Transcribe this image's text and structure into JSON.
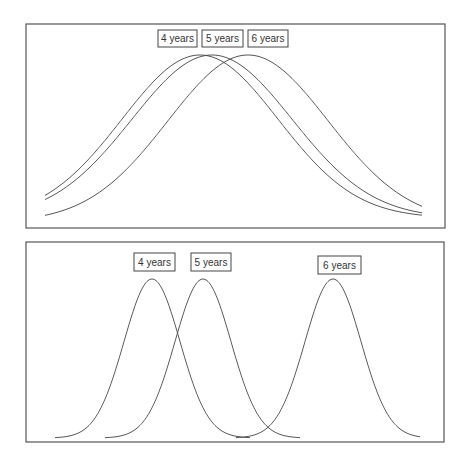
{
  "panels": [
    {
      "name": "top-panel",
      "frame": {
        "x": 26,
        "y": 24,
        "w": 419,
        "h": 204
      },
      "baseline_x": [
        45,
        422
      ],
      "curves": [
        {
          "label": "4 years",
          "mu": 200,
          "sigma": 78,
          "peak_y": 55,
          "base_y": 218,
          "x0": 45,
          "x1": 422
        },
        {
          "label": "5 years",
          "mu": 212,
          "sigma": 80,
          "peak_y": 55,
          "base_y": 218,
          "x0": 45,
          "x1": 422
        },
        {
          "label": "6 years",
          "mu": 248,
          "sigma": 80,
          "peak_y": 55,
          "base_y": 222,
          "x0": 45,
          "x1": 422
        }
      ],
      "labels": [
        {
          "text": "4 years",
          "x": 158,
          "y": 30,
          "w": 39,
          "h": 17
        },
        {
          "text": "5 years",
          "x": 202,
          "y": 30,
          "w": 41,
          "h": 17
        },
        {
          "text": "6 years",
          "x": 248,
          "y": 30,
          "w": 40,
          "h": 17
        }
      ]
    },
    {
      "name": "bottom-panel",
      "frame": {
        "x": 26,
        "y": 242,
        "w": 418,
        "h": 200
      },
      "curves": [
        {
          "label": "4 years",
          "mu": 152,
          "sigma": 28,
          "peak_y": 279,
          "base_y": 438,
          "x0": 55,
          "x1": 250
        },
        {
          "label": "5 years",
          "mu": 203,
          "sigma": 28,
          "peak_y": 279,
          "base_y": 438,
          "x0": 105,
          "x1": 300
        },
        {
          "label": "6 years",
          "mu": 333,
          "sigma": 28,
          "peak_y": 279,
          "base_y": 438,
          "x0": 236,
          "x1": 420
        }
      ],
      "labels": [
        {
          "text": "4 years",
          "x": 134,
          "y": 253,
          "w": 41,
          "h": 18
        },
        {
          "text": "5 years",
          "x": 191,
          "y": 253,
          "w": 40,
          "h": 18
        },
        {
          "text": "6 years",
          "x": 318,
          "y": 256,
          "w": 43,
          "h": 18
        }
      ]
    }
  ],
  "chart_data": [
    {
      "type": "line",
      "title": "",
      "description": "Three heavily overlapping bell curves (wide spread, close means)",
      "series": [
        {
          "name": "4 years",
          "mean_px": 200,
          "relative_spread": "wide"
        },
        {
          "name": "5 years",
          "mean_px": 212,
          "relative_spread": "wide"
        },
        {
          "name": "6 years",
          "mean_px": 248,
          "relative_spread": "wide"
        }
      ],
      "xlabel": "",
      "ylabel": "",
      "grid": false,
      "legend": "boxed labels above peaks"
    },
    {
      "type": "line",
      "title": "",
      "description": "Three narrow bell curves with separated means",
      "series": [
        {
          "name": "4 years",
          "mean_px": 152,
          "relative_spread": "narrow"
        },
        {
          "name": "5 years",
          "mean_px": 203,
          "relative_spread": "narrow"
        },
        {
          "name": "6 years",
          "mean_px": 333,
          "relative_spread": "narrow"
        }
      ],
      "xlabel": "",
      "ylabel": "",
      "grid": false,
      "legend": "boxed labels above peaks"
    }
  ]
}
